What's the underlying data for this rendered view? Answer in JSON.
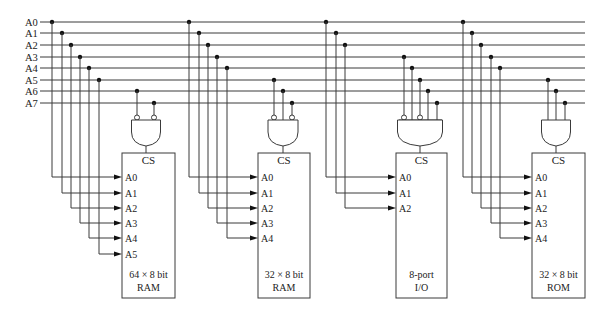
{
  "diagram": {
    "type": "address-decoding-circuit",
    "bus": {
      "lines": [
        "A0",
        "A1",
        "A2",
        "A3",
        "A4",
        "A5",
        "A6",
        "A7"
      ],
      "y": [
        22,
        33,
        45,
        57,
        68,
        80,
        91,
        103
      ],
      "x_start": 40,
      "x_end": 585,
      "label_x": 25
    },
    "chips": [
      {
        "id": "ram64",
        "label_line1": "64 × 8 bit",
        "label_line2": "RAM",
        "chip_select": "CS",
        "box": {
          "x": 122,
          "y": 153,
          "w": 53,
          "h": 145
        },
        "address_pins": [
          "A0",
          "A1",
          "A2",
          "A3",
          "A4",
          "A5"
        ],
        "address_drop_x": [
          52,
          62,
          71,
          80,
          89,
          99
        ],
        "gate": {
          "cx": 146,
          "inputs": [
            {
              "line": "A6",
              "x": 137,
              "inverted": true
            },
            {
              "line": "A7",
              "x": 154,
              "inverted": true
            }
          ]
        }
      },
      {
        "id": "ram32",
        "label_line1": "32 × 8 bit",
        "label_line2": "RAM",
        "chip_select": "CS",
        "box": {
          "x": 258,
          "y": 153,
          "w": 52,
          "h": 145
        },
        "address_pins": [
          "A0",
          "A1",
          "A2",
          "A3",
          "A4"
        ],
        "address_drop_x": [
          189,
          199,
          208,
          217,
          227
        ],
        "gate": {
          "cx": 283,
          "inputs": [
            {
              "line": "A5",
              "x": 274,
              "inverted": true
            },
            {
              "line": "A6",
              "x": 283,
              "inverted": false
            },
            {
              "line": "A7",
              "x": 292,
              "inverted": true
            }
          ]
        }
      },
      {
        "id": "io8",
        "label_line1": "8-port",
        "label_line2": "I/O",
        "chip_select": "CS",
        "box": {
          "x": 396,
          "y": 153,
          "w": 51,
          "h": 145
        },
        "address_pins": [
          "A0",
          "A1",
          "A2"
        ],
        "address_drop_x": [
          326,
          336,
          345
        ],
        "gate": {
          "cx": 420,
          "bar": true,
          "inputs": [
            {
              "line": "A3",
              "x": 404,
              "inverted": true
            },
            {
              "line": "A4",
              "x": 412,
              "inverted": false
            },
            {
              "line": "A5",
              "x": 420,
              "inverted": true
            },
            {
              "line": "A6",
              "x": 428,
              "inverted": false
            },
            {
              "line": "A7",
              "x": 437,
              "inverted": false
            }
          ]
        }
      },
      {
        "id": "rom32",
        "label_line1": "32 × 8 bit",
        "label_line2": "ROM",
        "chip_select": "CS",
        "box": {
          "x": 532,
          "y": 153,
          "w": 53,
          "h": 145
        },
        "address_pins": [
          "A0",
          "A1",
          "A2",
          "A3",
          "A4"
        ],
        "address_drop_x": [
          463,
          472,
          481,
          491,
          500
        ],
        "gate": {
          "cx": 556,
          "inputs": [
            {
              "line": "A5",
              "x": 548,
              "inverted": false
            },
            {
              "line": "A6",
              "x": 556,
              "inverted": false
            },
            {
              "line": "A7",
              "x": 565,
              "inverted": false
            }
          ]
        }
      }
    ],
    "pin_rows_y": [
      177,
      193,
      208,
      223,
      238,
      254
    ],
    "colors": {
      "wire": "#3a3a3a",
      "dot": "#111111",
      "background": "#ffffff"
    }
  }
}
